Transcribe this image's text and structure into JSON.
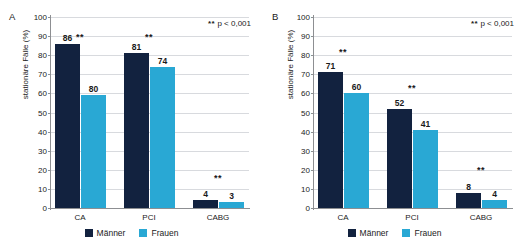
{
  "figure": {
    "background": "#ffffff",
    "series_colors": {
      "maenner": "#12223f",
      "frauen": "#29a8d4"
    },
    "grid_color": "#d8dade",
    "axis_color": "#8d8f92"
  },
  "legend": {
    "maenner_label": "Männer",
    "frauen_label": "Frauen"
  },
  "annotation": {
    "stars": "**",
    "text": "p < 0,001"
  },
  "yticks": [
    "100",
    "90",
    "80",
    "70",
    "60",
    "50",
    "40",
    "30",
    "20",
    "10",
    "0"
  ],
  "panels": [
    {
      "letter": "A",
      "ylabel": "stationäre Fälle (%)",
      "categories": [
        "CA",
        "PCI",
        "CABG"
      ],
      "significance": [
        "**",
        "**",
        "**"
      ],
      "labels_maenner": [
        "86",
        "81",
        "4"
      ],
      "labels_frauen": [
        "80",
        "74",
        "3"
      ],
      "heights_maenner": [
        86,
        81,
        4
      ],
      "heights_frauen": [
        59,
        74,
        3
      ]
    },
    {
      "letter": "B",
      "ylabel": "stationäre Fälle (%)",
      "categories": [
        "CA",
        "PCI",
        "CABG"
      ],
      "significance": [
        "**",
        "**",
        "**"
      ],
      "labels_maenner": [
        "71",
        "52",
        "8"
      ],
      "labels_frauen": [
        "60",
        "41",
        "4"
      ],
      "heights_maenner": [
        71,
        52,
        8
      ],
      "heights_frauen": [
        60,
        41,
        4
      ]
    }
  ],
  "chart_data": {
    "type": "bar",
    "title": "",
    "subtitle": "",
    "xlabel": "",
    "ylabel": "stationäre Fälle (%)",
    "ylim": [
      0,
      100
    ],
    "ytick_step": 10,
    "grid": true,
    "legend_position": "bottom-center",
    "panels": [
      {
        "panel": "A",
        "categories": [
          "CA",
          "PCI",
          "CABG"
        ],
        "series": [
          {
            "name": "Männer",
            "values": [
              86,
              81,
              4
            ],
            "color": "#12223f"
          },
          {
            "name": "Frauen",
            "values": [
              80,
              74,
              3
            ],
            "color": "#29a8d4"
          }
        ],
        "annotations": [
          "**",
          "**",
          "**"
        ],
        "note": "** p < 0,001"
      },
      {
        "panel": "B",
        "categories": [
          "CA",
          "PCI",
          "CABG"
        ],
        "series": [
          {
            "name": "Männer",
            "values": [
              71,
              52,
              8
            ],
            "color": "#12223f"
          },
          {
            "name": "Frauen",
            "values": [
              60,
              41,
              4
            ],
            "color": "#29a8d4"
          }
        ],
        "annotations": [
          "**",
          "**",
          "**"
        ],
        "note": "** p < 0,001"
      }
    ]
  }
}
